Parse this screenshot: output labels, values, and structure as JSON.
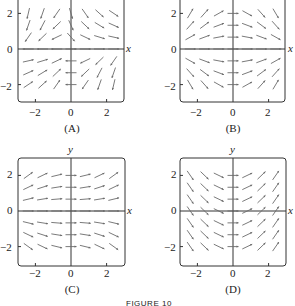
{
  "figure_caption": "FIGURE 10",
  "axis_labels": {
    "x": "x",
    "y": "y"
  },
  "tick_labels": {
    "x": [
      "−2",
      "0",
      "2"
    ],
    "y": [
      "2",
      "0",
      "−2"
    ]
  },
  "panels": [
    {
      "id": "A",
      "caption": "(A)",
      "field": "A"
    },
    {
      "id": "B",
      "caption": "(B)",
      "field": "B"
    },
    {
      "id": "C",
      "caption": "(C)",
      "field": "C"
    },
    {
      "id": "D",
      "caption": "(D)",
      "field": "D"
    }
  ],
  "colors": {
    "axis": "#333333",
    "arrow": "#6b6b6b",
    "frame": "#333333"
  }
}
